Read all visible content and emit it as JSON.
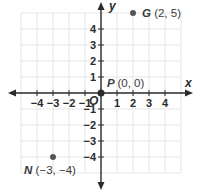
{
  "chart_data": {
    "type": "scatter",
    "title": "",
    "xlabel": "x",
    "ylabel": "y",
    "origin_label": "O",
    "xlim": [
      -5,
      5
    ],
    "ylim": [
      -5,
      5
    ],
    "grid": true,
    "x_ticks": [
      -4,
      -3,
      -2,
      -1,
      1,
      2,
      3,
      4
    ],
    "y_ticks": [
      4,
      3,
      2,
      1,
      -1,
      -2,
      -3,
      -4
    ],
    "x_tick_labels": [
      "−4",
      "−3",
      "−2",
      "−1",
      "1",
      "2",
      "3",
      "4"
    ],
    "y_tick_labels": [
      "4",
      "3",
      "2",
      "1",
      "−1",
      "−2",
      "−3",
      "−4"
    ],
    "points": [
      {
        "name": "G",
        "x": 2,
        "y": 5,
        "coords": "(2, 5)"
      },
      {
        "name": "P",
        "x": 0,
        "y": 0,
        "coords": "(0, 0)"
      },
      {
        "name": "N",
        "x": -3,
        "y": -4,
        "coords": "(−3, −4)"
      }
    ]
  },
  "colors": {
    "axis": "#2b2b2b",
    "grid": "#e6e6e6",
    "point": "#555555",
    "label": "#3a3a3a"
  }
}
